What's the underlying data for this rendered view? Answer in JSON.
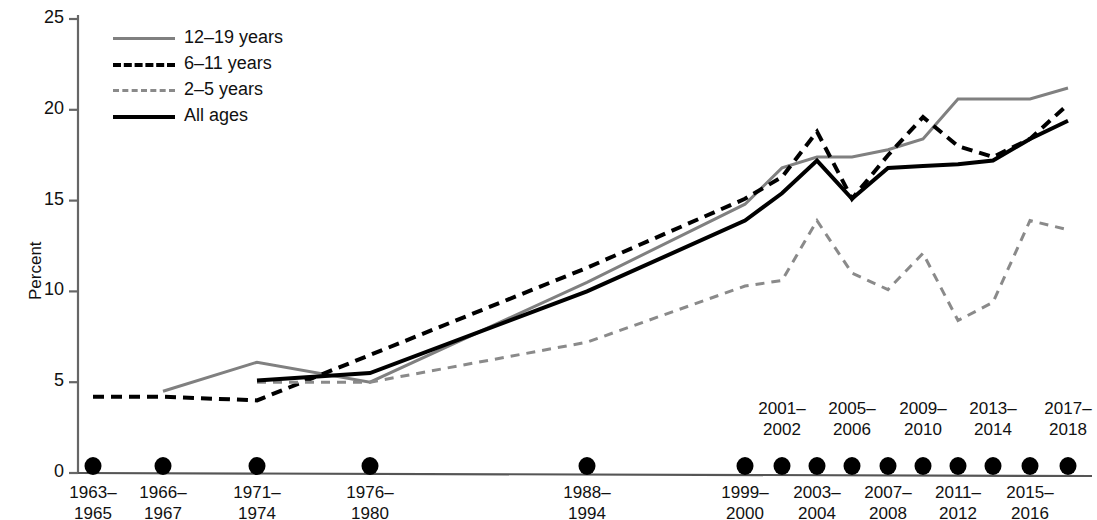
{
  "chart_data": {
    "type": "line",
    "title": "",
    "xlabel": "",
    "ylabel": "Percent",
    "ylim": [
      0,
      25
    ],
    "yticks": [
      0,
      5,
      10,
      15,
      20,
      25
    ],
    "ytick_labels": [
      "0",
      "5",
      "10",
      "15",
      "20",
      "25"
    ],
    "grid": false,
    "legend_position": "top-left",
    "categories": [
      "1963–1965",
      "1966–1967",
      "1971–1974",
      "1976–1980",
      "1988–1994",
      "1999–2000",
      "2001–2002",
      "2003–2004",
      "2005–2006",
      "2007–2008",
      "2009–2010",
      "2011–2012",
      "2013–2014",
      "2015–2016",
      "2017–2018"
    ],
    "category_rows": [
      {
        "row": "bottom",
        "label": "1963–",
        "label2": "1965"
      },
      {
        "row": "bottom",
        "label": "1966–",
        "label2": "1967"
      },
      {
        "row": "bottom",
        "label": "1971–",
        "label2": "1974"
      },
      {
        "row": "bottom",
        "label": "1976–",
        "label2": "1980"
      },
      {
        "row": "bottom",
        "label": "1988–",
        "label2": "1994"
      },
      {
        "row": "bottom",
        "label": "1999–",
        "label2": "2000"
      },
      {
        "row": "top",
        "label": "2001–",
        "label2": "2002"
      },
      {
        "row": "bottom",
        "label": "2003–",
        "label2": "2004"
      },
      {
        "row": "top",
        "label": "2005–",
        "label2": "2006"
      },
      {
        "row": "bottom",
        "label": "2007–",
        "label2": "2008"
      },
      {
        "row": "top",
        "label": "2009–",
        "label2": "2010"
      },
      {
        "row": "bottom",
        "label": "2011–",
        "label2": "2012"
      },
      {
        "row": "top",
        "label": "2013–",
        "label2": "2014"
      },
      {
        "row": "bottom",
        "label": "2015–",
        "label2": "2016"
      },
      {
        "row": "top",
        "label": "2017–",
        "label2": "2018"
      }
    ],
    "series": [
      {
        "name": "12–19 years",
        "style": "solid",
        "color": "#808080",
        "width": 3,
        "values": [
          null,
          4.5,
          6.1,
          5.0,
          10.5,
          14.8,
          16.8,
          17.4,
          17.4,
          17.8,
          18.4,
          20.6,
          20.6,
          20.6,
          21.2
        ]
      },
      {
        "name": "6–11 years",
        "style": "dashed",
        "color": "#000000",
        "width": 4,
        "values": [
          4.2,
          4.2,
          4.0,
          6.5,
          11.3,
          15.1,
          16.3,
          18.8,
          15.1,
          17.5,
          19.6,
          18.0,
          17.4,
          18.4,
          20.3
        ]
      },
      {
        "name": "2–5 years",
        "style": "dashed",
        "color": "#8a8a8a",
        "width": 3,
        "values": [
          null,
          null,
          5.0,
          5.0,
          7.2,
          10.3,
          10.6,
          13.9,
          11.0,
          10.1,
          12.1,
          8.4,
          9.4,
          13.9,
          13.4
        ]
      },
      {
        "name": "All ages",
        "style": "solid",
        "color": "#000000",
        "width": 4,
        "values": [
          null,
          null,
          5.1,
          5.5,
          10.0,
          13.9,
          15.4,
          17.2,
          15.1,
          16.8,
          16.9,
          17.0,
          17.2,
          18.4,
          19.4
        ]
      }
    ],
    "markers": {
      "shape": "circle",
      "color": "#000000",
      "on_axis": true,
      "note": "Filled circular markers sit on the x-axis at every survey period."
    }
  },
  "axis": {
    "y_title": "Percent"
  },
  "legend": {
    "items": [
      {
        "label": "12–19 years",
        "swatch": "line-solid-gray-icon"
      },
      {
        "label": "6–11 years",
        "swatch": "line-dashed-black-icon"
      },
      {
        "label": "2–5 years",
        "swatch": "line-dashed-gray-icon"
      },
      {
        "label": "All ages",
        "swatch": "line-solid-black-icon"
      }
    ]
  }
}
